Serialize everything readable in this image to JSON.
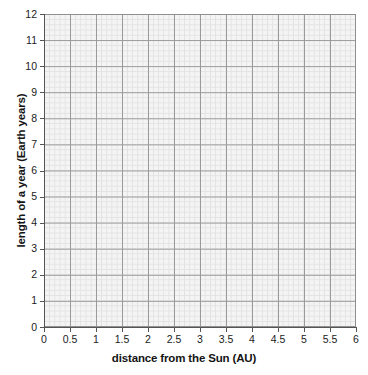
{
  "chart_data": {
    "type": "scatter",
    "title": "",
    "subtitle": "",
    "xlabel": "distance from the Sun (AU)",
    "ylabel": "length of a year (Earth years)",
    "xlim": [
      0,
      6
    ],
    "ylim": [
      0,
      12
    ],
    "x_major_step": 0.5,
    "y_major_step": 1,
    "x_minor_divisions_per_major": 5,
    "y_minor_divisions_per_major": 5,
    "grid": true,
    "grid_style": "graph-paper",
    "legend": null,
    "legend_position": "none",
    "annotations": [],
    "series": [],
    "x": [],
    "values": [],
    "note": "Blank grid - no data points, lines, bars or markers are plotted in the image",
    "xticklabels": [
      "0",
      "0.5",
      "1",
      "1.5",
      "2",
      "2.5",
      "3",
      "3.5",
      "4",
      "4.5",
      "5",
      "5.5",
      "6"
    ],
    "xtickvalues": [
      0,
      0.5,
      1,
      1.5,
      2,
      2.5,
      3,
      3.5,
      4,
      4.5,
      5,
      5.5,
      6
    ],
    "yticklabels": [
      "0",
      "1",
      "2",
      "3",
      "4",
      "5",
      "6",
      "7",
      "8",
      "9",
      "10",
      "11",
      "12"
    ],
    "ytickvalues": [
      0,
      1,
      2,
      3,
      4,
      5,
      6,
      7,
      8,
      9,
      10,
      11,
      12
    ],
    "colors": {
      "plot_background": "#f4f4f4",
      "figure_background": "#ffffff",
      "major_gridline": "#9a9a9a",
      "minor_gridline": "#e2e2e2",
      "axis_spine": "#555555",
      "tick_label": "#1b1b1b",
      "axis_title": "#141414"
    }
  }
}
